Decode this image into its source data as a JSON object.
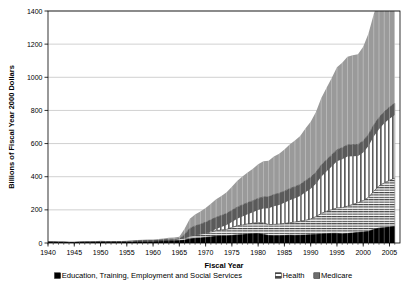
{
  "chart_data": {
    "type": "area",
    "stacked": true,
    "title": "",
    "xlabel": "Fiscal Year",
    "ylabel": "Billions of Fiscal Year 2000 Dollars",
    "xlim": [
      1940,
      2007
    ],
    "ylim": [
      0,
      1400
    ],
    "yticks": [
      0,
      200,
      400,
      600,
      800,
      1000,
      1200,
      1400
    ],
    "xticks": [
      1940,
      1945,
      1950,
      1955,
      1960,
      1965,
      1970,
      1975,
      1980,
      1985,
      1990,
      1995,
      2000,
      2005
    ],
    "grid": true,
    "grid_axis": "y",
    "legend_position": "bottom",
    "plot_border": true,
    "colors": {
      "education": "#000000",
      "health": "#ffffff",
      "health_hatch": "#555555",
      "medicare": "#ffffff",
      "medicare_hatch": "#555555",
      "top_band": "#9a9a9a",
      "mid_band": "#5a5a5a",
      "gridline": "#bbbbbb",
      "axis": "#000000",
      "background": "#ffffff"
    },
    "x": [
      1940,
      1941,
      1942,
      1943,
      1944,
      1945,
      1946,
      1947,
      1948,
      1949,
      1950,
      1951,
      1952,
      1953,
      1954,
      1955,
      1956,
      1957,
      1958,
      1959,
      1960,
      1961,
      1962,
      1963,
      1964,
      1965,
      1966,
      1967,
      1968,
      1969,
      1970,
      1971,
      1972,
      1973,
      1974,
      1975,
      1976,
      1977,
      1978,
      1979,
      1980,
      1981,
      1982,
      1983,
      1984,
      1985,
      1986,
      1987,
      1988,
      1989,
      1990,
      1991,
      1992,
      1993,
      1994,
      1995,
      1996,
      1997,
      1998,
      1999,
      2000,
      2001,
      2002,
      2003,
      2004,
      2005,
      2006
    ],
    "series": [
      {
        "name": "Education, Training, Employment and Social Services",
        "pattern": "solid-black",
        "legend_marker": "solid-black",
        "values": [
          5,
          5,
          4,
          4,
          3,
          3,
          4,
          4,
          4,
          5,
          6,
          5,
          5,
          5,
          5,
          6,
          6,
          7,
          7,
          8,
          8,
          9,
          10,
          11,
          12,
          14,
          18,
          24,
          28,
          30,
          33,
          36,
          40,
          42,
          42,
          45,
          49,
          50,
          54,
          56,
          57,
          52,
          45,
          44,
          44,
          45,
          47,
          46,
          47,
          48,
          50,
          51,
          54,
          56,
          58,
          58,
          55,
          57,
          60,
          63,
          66,
          70,
          82,
          90,
          92,
          96,
          99
        ]
      },
      {
        "name": "Health",
        "pattern": "horizontal-stripes",
        "legend_marker": "horizontal-stripes",
        "values": [
          1,
          1,
          1,
          1,
          1,
          1,
          1,
          2,
          2,
          2,
          3,
          3,
          3,
          3,
          3,
          3,
          4,
          4,
          5,
          5,
          5,
          6,
          7,
          8,
          8,
          9,
          12,
          16,
          20,
          23,
          26,
          30,
          35,
          36,
          40,
          48,
          55,
          58,
          61,
          63,
          66,
          68,
          66,
          68,
          70,
          72,
          75,
          80,
          84,
          88,
          95,
          108,
          124,
          135,
          143,
          153,
          158,
          165,
          172,
          180,
          190,
          205,
          230,
          255,
          270,
          282,
          292
        ]
      },
      {
        "name": "Medicare",
        "pattern": "vertical-stripes",
        "legend_marker": "solid-gray",
        "values": [
          0,
          0,
          0,
          0,
          0,
          0,
          0,
          0,
          0,
          0,
          0,
          0,
          0,
          0,
          0,
          0,
          0,
          0,
          0,
          0,
          0,
          0,
          0,
          0,
          0,
          0,
          22,
          48,
          55,
          60,
          66,
          74,
          80,
          88,
          96,
          104,
          112,
          122,
          128,
          136,
          146,
          158,
          168,
          180,
          186,
          196,
          206,
          214,
          222,
          240,
          252,
          268,
          292,
          310,
          330,
          352,
          362,
          370,
          362,
          352,
          360,
          380,
          400,
          412,
          430,
          442,
          452
        ]
      }
    ],
    "totals_note": "Top of stack reaches about 1280 billion in 2006"
  },
  "legend": {
    "entries": [
      {
        "label": "Education, Training, Employment and Social Services"
      },
      {
        "label": "Health"
      },
      {
        "label": "Medicare"
      }
    ]
  },
  "axes": {
    "y_title": "Billions of Fiscal Year 2000 Dollars",
    "x_title": "Fiscal Year",
    "y_tick_labels": [
      "0",
      "200",
      "400",
      "600",
      "800",
      "1000",
      "1200",
      "1400"
    ],
    "x_tick_labels": [
      "1940",
      "1945",
      "1950",
      "1955",
      "1960",
      "1965",
      "1970",
      "1975",
      "1980",
      "1985",
      "1990",
      "1995",
      "2000",
      "2005"
    ]
  }
}
